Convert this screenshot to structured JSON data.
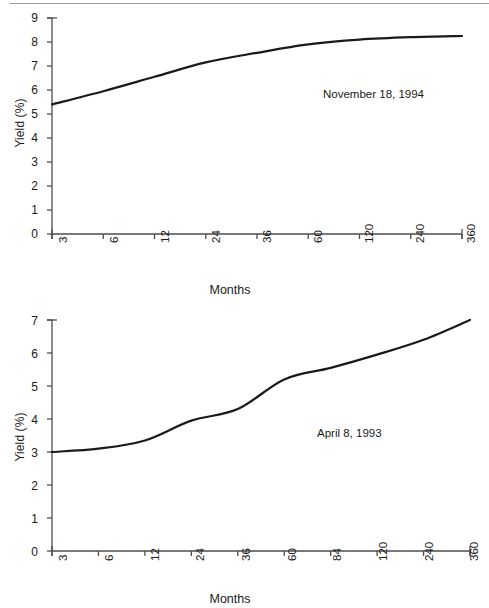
{
  "chart_data": [
    {
      "id": "top",
      "type": "line",
      "title": "",
      "annotation": "November 18, 1994",
      "xlabel": "Months",
      "ylabel": "Yield (%)",
      "categories": [
        "3",
        "6",
        "12",
        "24",
        "36",
        "60",
        "120",
        "240",
        "360"
      ],
      "x_tick_labels": [
        "3",
        "6",
        "12",
        "24",
        "36",
        "60",
        "120",
        "240",
        "360"
      ],
      "y_tick_labels": [
        "0",
        "1",
        "2",
        "3",
        "4",
        "5",
        "6",
        "7",
        "8",
        "9"
      ],
      "ylim": [
        0,
        9
      ],
      "grid": false,
      "legend": "none",
      "series": [
        {
          "name": "Treasury yield curve",
          "values": [
            5.4,
            5.95,
            6.55,
            7.15,
            7.55,
            7.9,
            8.1,
            8.2,
            8.25
          ]
        }
      ]
    },
    {
      "id": "bottom",
      "type": "line",
      "title": "",
      "annotation": "April 8, 1993",
      "xlabel": "Months",
      "ylabel": "Yield (%)",
      "categories": [
        "3",
        "6",
        "12",
        "24",
        "36",
        "60",
        "84",
        "120",
        "240",
        "360"
      ],
      "x_tick_labels": [
        "3",
        "6",
        "12",
        "24",
        "36",
        "60",
        "84",
        "120",
        "240",
        "360"
      ],
      "y_tick_labels": [
        "0",
        "1",
        "2",
        "3",
        "4",
        "5",
        "6",
        "7"
      ],
      "ylim": [
        0,
        7
      ],
      "grid": false,
      "legend": "none",
      "series": [
        {
          "name": "Treasury yield curve",
          "values": [
            3.0,
            3.1,
            3.35,
            3.95,
            4.3,
            5.2,
            5.55,
            5.95,
            6.4,
            7.0
          ]
        }
      ]
    }
  ],
  "figures": {
    "top": {
      "ylabel": "Yield (%)",
      "xlabel": "Months",
      "annotation": "November 18, 1994",
      "ytick0": "0",
      "ytick1": "1",
      "ytick2": "2",
      "ytick3": "3",
      "ytick4": "4",
      "ytick5": "5",
      "ytick6": "6",
      "ytick7": "7",
      "ytick8": "8",
      "ytick9": "9",
      "xtick0": "3",
      "xtick1": "6",
      "xtick2": "12",
      "xtick3": "24",
      "xtick4": "36",
      "xtick5": "60",
      "xtick6": "120",
      "xtick7": "240",
      "xtick8": "360"
    },
    "bottom": {
      "ylabel": "Yield (%)",
      "xlabel": "Months",
      "annotation": "April 8, 1993",
      "ytick0": "0",
      "ytick1": "1",
      "ytick2": "2",
      "ytick3": "3",
      "ytick4": "4",
      "ytick5": "5",
      "ytick6": "6",
      "ytick7": "7",
      "xtick0": "3",
      "xtick1": "6",
      "xtick2": "12",
      "xtick3": "24",
      "xtick4": "36",
      "xtick5": "60",
      "xtick6": "84",
      "xtick7": "120",
      "xtick8": "240",
      "xtick9": "360"
    }
  },
  "colors": {
    "ink": "#1a1a1a",
    "axis": "#4d4d4d",
    "rule": "#9a9a9a",
    "background": "#ffffff"
  }
}
